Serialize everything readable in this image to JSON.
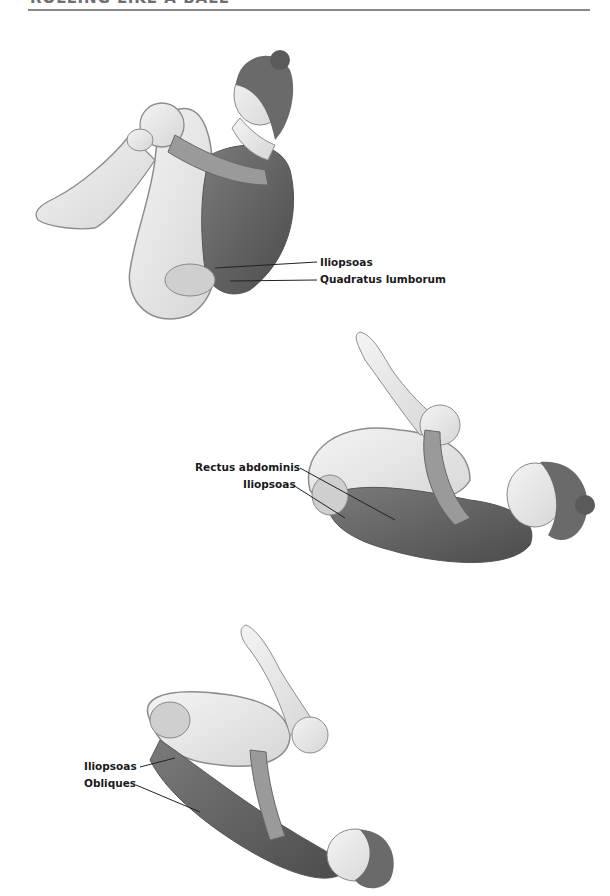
{
  "header": {
    "title": "ROLLING LIKE A BALL"
  },
  "figures": [
    {
      "id": "figure-1",
      "description": "Seated balance position, knees held to chest, muscles highlighted",
      "labels": [
        {
          "text": "Iliopsoas"
        },
        {
          "text": "Quadratus lumborum"
        }
      ]
    },
    {
      "id": "figure-2",
      "description": "Rolled back position, shoulders down, knees to chest",
      "labels": [
        {
          "text": "Rectus abdominis"
        },
        {
          "text": "Iliopsoas"
        }
      ]
    },
    {
      "id": "figure-3",
      "description": "Fully rolled back position, feet up, head down",
      "labels": [
        {
          "text": "Iliopsoas"
        },
        {
          "text": "Obliques"
        }
      ]
    }
  ],
  "colors": {
    "muscle": "#5e5e5e",
    "skin": "#e8e8e8",
    "outline": "#8c8c8c",
    "rule": "#8a8a8a",
    "label_text": "#1a1a1a"
  }
}
